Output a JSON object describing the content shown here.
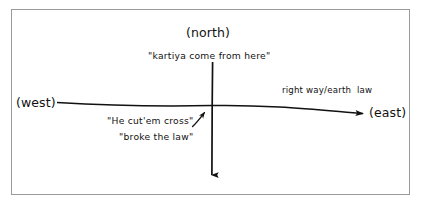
{
  "figure": {
    "kind": "hand-drawn axes diagram",
    "background_color": "#ffffff",
    "border_color": "#9a9a9a",
    "ink_color": "#111111"
  },
  "labels": {
    "north": "(north)",
    "west": "(west)",
    "east": "(east)",
    "kartiya": "\"kartiya come from here\"",
    "cut_em_cross": "\"He cut'em cross\"",
    "broke_the_law": "\"broke the law\"",
    "right_way": "right way/earth  law"
  },
  "arrows": {
    "vertical": {
      "name": "north-south-axis-arrow",
      "from": "north (top)",
      "to": "south (bottom)",
      "direction": "downward"
    },
    "horizontal": {
      "name": "west-east-axis-arrow",
      "from": "west (left)",
      "to": "east (right)",
      "direction": "rightward"
    },
    "pointer": {
      "name": "crossing-point-pointer-arrow",
      "direction": "up-right toward intersection"
    }
  }
}
